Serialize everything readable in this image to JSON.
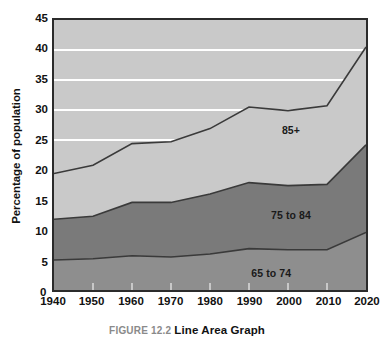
{
  "figure": {
    "caption_prefix": "FIGURE 12.2",
    "caption_title": "Line Area Graph"
  },
  "colors": {
    "band_65_74": "#8e8e8e",
    "band_75_84": "#7a7a7a",
    "band_85_plus": "#c9c9c9",
    "gridline": "#ffffff",
    "series_outline": "#3a3a3a",
    "frame": "#2b2b2b",
    "axis_text": "#111111",
    "caption_prefix_color": "#8a8a8a"
  },
  "chart_data": {
    "type": "area",
    "title": "",
    "subtitle": "",
    "xlabel": "",
    "ylabel": "Percentage of population",
    "x": [
      1940,
      1950,
      1960,
      1970,
      1980,
      1990,
      2000,
      2010,
      2020
    ],
    "xticklabels": [
      "1940",
      "1950",
      "1960",
      "1970",
      "1980",
      "1990",
      "2000",
      "2010",
      "2020"
    ],
    "yticklabels": [
      "0",
      "5",
      "10",
      "15",
      "20",
      "25",
      "30",
      "35",
      "40",
      "45"
    ],
    "yticks": [
      0,
      5,
      10,
      15,
      20,
      25,
      30,
      35,
      40,
      45
    ],
    "ylim": [
      0,
      45
    ],
    "xlim": [
      1940,
      2020
    ],
    "stacked": true,
    "grid": "horizontal",
    "gridline_values": [
      25,
      30,
      35,
      40
    ],
    "legend_position": "inline-annotations",
    "series": [
      {
        "name": "65 to 74",
        "label": "65 to 74",
        "color": "#8e8e8e",
        "values": [
          5.0,
          5.2,
          5.7,
          5.5,
          6.0,
          6.9,
          6.7,
          6.7,
          9.6
        ],
        "cumulative": [
          5.0,
          5.2,
          5.7,
          5.5,
          6.0,
          6.9,
          6.7,
          6.7,
          9.6
        ]
      },
      {
        "name": "75 to 84",
        "label": "75 to 84",
        "color": "#7a7a7a",
        "values": [
          6.8,
          7.1,
          8.9,
          9.1,
          10.0,
          11.0,
          10.7,
          10.9,
          14.6
        ],
        "cumulative": [
          11.8,
          12.3,
          14.6,
          14.6,
          16.0,
          17.9,
          17.4,
          17.6,
          24.2
        ]
      },
      {
        "name": "85+",
        "label": "85+",
        "color": "#c9c9c9",
        "values": [
          7.6,
          8.5,
          9.8,
          10.1,
          10.9,
          12.6,
          12.5,
          13.1,
          16.3
        ],
        "cumulative": [
          19.4,
          20.8,
          24.4,
          24.7,
          26.9,
          30.5,
          29.9,
          30.7,
          40.5
        ]
      }
    ]
  }
}
